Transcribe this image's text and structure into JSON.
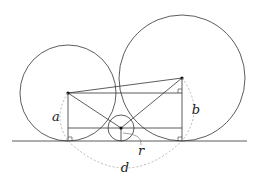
{
  "diagram": {
    "labels": {
      "a": "a",
      "b": "b",
      "r": "r",
      "d": "d"
    },
    "colors": {
      "stroke": "#333333",
      "dashed": "#999999",
      "background": "#ffffff"
    },
    "circles": [
      {
        "name": "left-circle",
        "cx": 68,
        "cy": 93,
        "r": 48
      },
      {
        "name": "right-circle",
        "cx": 182,
        "cy": 78,
        "r": 63
      },
      {
        "name": "small-circle",
        "cx": 121,
        "cy": 128,
        "r": 13
      }
    ],
    "ground_y": 141
  }
}
